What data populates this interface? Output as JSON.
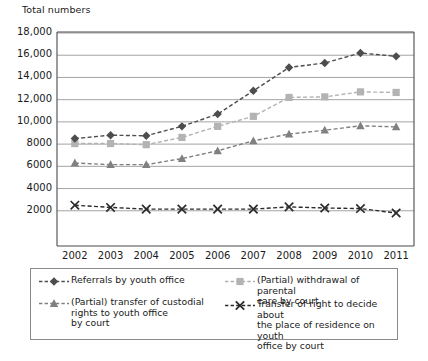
{
  "chart_data": {
    "type": "line",
    "title": "Total numbers",
    "xlabel": "",
    "ylabel": "Total numbers",
    "x": [
      2002,
      2003,
      2004,
      2005,
      2006,
      2007,
      2008,
      2009,
      2010,
      2011
    ],
    "categories": [
      "2002",
      "2003",
      "2004",
      "2005",
      "2006",
      "2007",
      "2008",
      "2009",
      "2010",
      "2011"
    ],
    "ylim": [
      0,
      18000
    ],
    "yticks": [
      2000,
      4000,
      6000,
      8000,
      10000,
      12000,
      14000,
      16000,
      18000
    ],
    "ytick_labels": [
      "2000",
      "4000",
      "6000",
      "8000",
      "10,000",
      "12,000",
      "14,000",
      "16,000",
      "18,000"
    ],
    "grid": "horizontal",
    "legend_position": "bottom",
    "series": [
      {
        "name": "Referrals by youth office",
        "marker": "diamond",
        "color": "#4d4d4d",
        "linestyle": "dashed",
        "values": [
          8500,
          8800,
          8750,
          9600,
          10700,
          12800,
          14900,
          15300,
          16200,
          15900
        ]
      },
      {
        "name": "(Partial) withdrawal of parental\ncare by court",
        "marker": "square",
        "color": "#b3b3b3",
        "linestyle": "dashed",
        "values": [
          8050,
          8050,
          7950,
          8600,
          9600,
          10500,
          12200,
          12250,
          12700,
          12650
        ]
      },
      {
        "name": "(Partial) transfer of custodial\nrights to youth office\nby court",
        "marker": "triangle",
        "color": "#808080",
        "linestyle": "dashed",
        "values": [
          6300,
          6150,
          6150,
          6700,
          7400,
          8300,
          8900,
          9250,
          9650,
          9550
        ]
      },
      {
        "name": "Transfer of right to decide about\nthe place of residence on youth\noffice by court",
        "marker": "x",
        "color": "#2b2b2b",
        "linestyle": "dashed",
        "values": [
          2500,
          2300,
          2150,
          2150,
          2150,
          2150,
          2350,
          2250,
          2200,
          1800
        ]
      }
    ]
  },
  "legend": {
    "items": [
      {
        "label": "Referrals by youth office",
        "marker": "diamond-marker-icon"
      },
      {
        "label": "(Partial) withdrawal of parental\ncare by court",
        "marker": "square-marker-icon"
      },
      {
        "label": "(Partial) transfer of custodial\nrights to youth office\nby court",
        "marker": "triangle-marker-icon"
      },
      {
        "label": "Transfer of right to decide about\nthe place of residence on youth\noffice by court",
        "marker": "x-marker-icon"
      }
    ]
  },
  "colors": {
    "series_diamond": "#4d4d4d",
    "series_square": "#b3b3b3",
    "series_triangle": "#808080",
    "series_x": "#2b2b2b",
    "grid": "#9a9a9a",
    "axis": "#4a4a4a",
    "text": "#1a1a1a"
  }
}
